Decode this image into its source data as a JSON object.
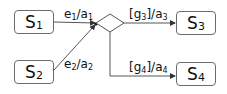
{
  "diagram": {
    "type": "statechart-choice-junction",
    "states": [
      {
        "id": "S1",
        "base": "S",
        "sub": "1"
      },
      {
        "id": "S2",
        "base": "S",
        "sub": "2"
      },
      {
        "id": "S3",
        "base": "S",
        "sub": "3"
      },
      {
        "id": "S4",
        "base": "S",
        "sub": "4"
      }
    ],
    "transitions": [
      {
        "from": "S1",
        "to": "junction",
        "label": {
          "e": "e",
          "e_sub": "1",
          "sep": "/",
          "a": "a",
          "a_sub": "1"
        }
      },
      {
        "from": "S2",
        "to": "junction",
        "label": {
          "e": "e",
          "e_sub": "2",
          "sep": "/",
          "a": "a",
          "a_sub": "2"
        }
      },
      {
        "from": "choice",
        "to": "S3",
        "label": {
          "open": "[",
          "g": "g",
          "g_sub": "3",
          "close": "]",
          "sep": "/",
          "a": "a",
          "a_sub": "3"
        }
      },
      {
        "from": "choice",
        "to": "S4",
        "label": {
          "open": "[",
          "g": "g",
          "g_sub": "4",
          "close": "]",
          "sep": "/",
          "a": "a",
          "a_sub": "4"
        }
      }
    ],
    "colors": {
      "line": "#444444",
      "border": "#6b6b6b",
      "text": "#111111"
    }
  }
}
